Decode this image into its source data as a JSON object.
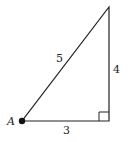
{
  "diagram": {
    "type": "right-triangle",
    "colors": {
      "stroke": "#222222",
      "background": "#ffffff",
      "point": "#111111"
    },
    "vertices": {
      "A": {
        "label": "A",
        "x": 22,
        "y": 121
      },
      "right_angle": {
        "x": 109,
        "y": 121
      },
      "top": {
        "x": 109,
        "y": 7
      }
    },
    "sides": {
      "base": {
        "label": "3"
      },
      "height": {
        "label": "4"
      },
      "hypotenuse": {
        "label": "5"
      }
    }
  }
}
